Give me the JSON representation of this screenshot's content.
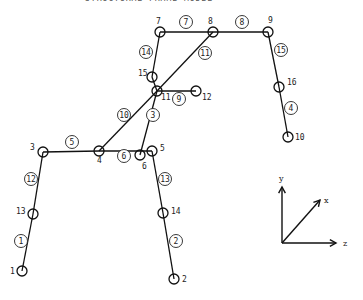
{
  "header": {
    "text": "STRUCTURAL FRAME MODEL"
  },
  "nodes": [
    {
      "id": "1",
      "x": 22,
      "y": 271,
      "lx": 10,
      "ly": 274
    },
    {
      "id": "2",
      "x": 174,
      "y": 279,
      "lx": 182,
      "ly": 282
    },
    {
      "id": "3",
      "x": 43,
      "y": 152,
      "lx": 30,
      "ly": 150
    },
    {
      "id": "4",
      "x": 99,
      "y": 151,
      "lx": 97,
      "ly": 163
    },
    {
      "id": "5",
      "x": 152,
      "y": 151,
      "lx": 160,
      "ly": 151
    },
    {
      "id": "6",
      "x": 140,
      "y": 155,
      "lx": 142,
      "ly": 169
    },
    {
      "id": "7",
      "x": 160,
      "y": 32,
      "lx": 156,
      "ly": 24
    },
    {
      "id": "8",
      "x": 213,
      "y": 32,
      "lx": 208,
      "ly": 24
    },
    {
      "id": "9",
      "x": 268,
      "y": 32,
      "lx": 268,
      "ly": 23
    },
    {
      "id": "10",
      "x": 288,
      "y": 137,
      "lx": 295,
      "ly": 140
    },
    {
      "id": "11",
      "x": 157,
      "y": 91,
      "lx": 161,
      "ly": 100
    },
    {
      "id": "12",
      "x": 196,
      "y": 91,
      "lx": 202,
      "ly": 100
    },
    {
      "id": "13",
      "x": 33,
      "y": 214,
      "lx": 16,
      "ly": 214
    },
    {
      "id": "14",
      "x": 163,
      "y": 213,
      "lx": 171,
      "ly": 214
    },
    {
      "id": "15",
      "x": 152,
      "y": 77,
      "lx": 138,
      "ly": 76
    },
    {
      "id": "16",
      "x": 279,
      "y": 87,
      "lx": 287,
      "ly": 85
    }
  ],
  "members": [
    {
      "id": "1",
      "from": "1",
      "to": "13",
      "lx": 21,
      "ly": 241
    },
    {
      "id": "2",
      "from": "14",
      "to": "2",
      "lx": 176,
      "ly": 241
    },
    {
      "id": "3",
      "from": "6",
      "to": "11",
      "lx": 153,
      "ly": 115
    },
    {
      "id": "4",
      "from": "16",
      "to": "10",
      "lx": 291,
      "ly": 108
    },
    {
      "id": "5",
      "from": "3",
      "to": "4",
      "lx": 72,
      "ly": 142
    },
    {
      "id": "6",
      "from": "4",
      "to": "5",
      "lx": 124,
      "ly": 156
    },
    {
      "id": "7",
      "from": "7",
      "to": "8",
      "lx": 186,
      "ly": 22
    },
    {
      "id": "8",
      "from": "8",
      "to": "9",
      "lx": 242,
      "ly": 22
    },
    {
      "id": "9",
      "from": "11",
      "to": "12",
      "lx": 179,
      "ly": 99
    },
    {
      "id": "10",
      "from": "4",
      "to": "11",
      "lx": 124,
      "ly": 115
    },
    {
      "id": "11",
      "from": "8",
      "to": "11",
      "lx": 205,
      "ly": 53
    },
    {
      "id": "12",
      "from": "13",
      "to": "3",
      "lx": 31,
      "ly": 179
    },
    {
      "id": "13",
      "from": "5",
      "to": "14",
      "lx": 165,
      "ly": 179
    },
    {
      "id": "14",
      "from": "7",
      "to": "15",
      "lx": 146,
      "ly": 52
    },
    {
      "id": "15",
      "from": "9",
      "to": "16",
      "lx": 281,
      "ly": 50
    }
  ],
  "extra_segments": [
    {
      "from": "15",
      "to": "11"
    }
  ],
  "axes": {
    "origin": {
      "x": 282,
      "y": 243
    },
    "y": {
      "label": "y",
      "x": 282,
      "y": 187,
      "lx": 279,
      "ly": 181
    },
    "x": {
      "label": "x",
      "x": 320,
      "y": 200,
      "lx": 324,
      "ly": 203
    },
    "z": {
      "label": "z",
      "x": 336,
      "y": 243,
      "lx": 343,
      "ly": 246
    }
  }
}
